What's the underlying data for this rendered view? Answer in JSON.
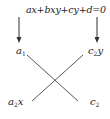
{
  "diagram": {
    "equation": "ax+bxy+cy+d=0",
    "labels": {
      "top_left": {
        "base": "a",
        "sub": "1",
        "suffix": ""
      },
      "top_right": {
        "base": "c",
        "sub": "2",
        "suffix": "y"
      },
      "bottom_left": {
        "base": "a",
        "sub": "2",
        "suffix": "x"
      },
      "bottom_right": {
        "base": "c",
        "sub": "2",
        "suffix": ""
      }
    },
    "arrows": [
      {
        "from": "equation",
        "to": "top_left",
        "direction": "down"
      },
      {
        "from": "equation",
        "to": "top_right",
        "direction": "down"
      }
    ],
    "cross_lines": [
      {
        "from": "top_left",
        "to": "bottom_right"
      },
      {
        "from": "top_right",
        "to": "bottom_left"
      }
    ],
    "colors": {
      "stroke": "#333333",
      "text": "#222222",
      "background": "#ffffff"
    }
  }
}
